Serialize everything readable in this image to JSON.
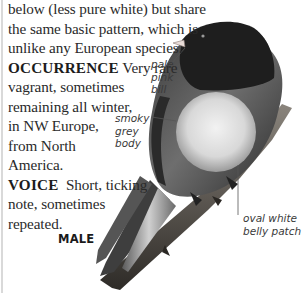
{
  "description": {
    "lines": [
      "below (less pure white) but share",
      "the same basic pattern, which is",
      "unlike any European species."
    ]
  },
  "occurrence": {
    "heading": "OCCURRENCE",
    "lines": [
      "Very rare",
      "vagrant, sometimes",
      "remaining all winter,",
      "in NW Europe,",
      "from North",
      "America."
    ]
  },
  "voice": {
    "heading": "VOICE",
    "lines": [
      "Short, ticking",
      "note, sometimes",
      "repeated."
    ]
  },
  "illustration": {
    "subject": "bird-on-branch",
    "sex_label": "MALE",
    "annotations": {
      "bill": [
        "pale",
        "pink",
        "bill"
      ],
      "body": [
        "smoky",
        "grey",
        "body"
      ],
      "belly": [
        "oval white",
        "belly patch"
      ]
    },
    "colors": {
      "head": "#1e1e1e",
      "body": "#6a6a6a",
      "belly": "#e6e6e6",
      "bill": "#e8d9d6",
      "branch": "#4a4640",
      "leader_line": "#555555"
    }
  }
}
